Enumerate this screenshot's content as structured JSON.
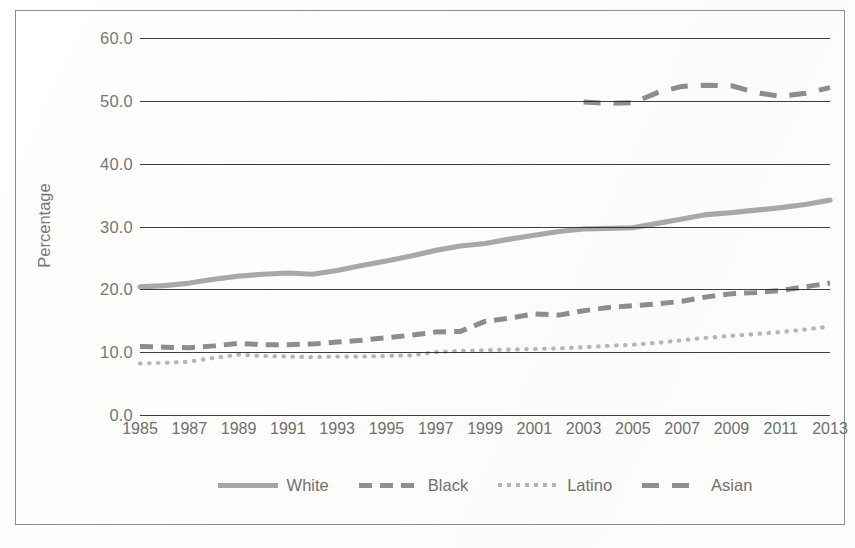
{
  "chart_data": {
    "type": "line",
    "title": "",
    "xlabel": "",
    "ylabel": "Percentage",
    "ylim": [
      0.0,
      60.0
    ],
    "yticks": [
      "0.0",
      "10.0",
      "20.0",
      "30.0",
      "40.0",
      "50.0",
      "60.0"
    ],
    "xlim": [
      1985,
      2013
    ],
    "xticks": [
      "1985",
      "1987",
      "1989",
      "1991",
      "1993",
      "1995",
      "1997",
      "1999",
      "2001",
      "2003",
      "2005",
      "2007",
      "2009",
      "2011",
      "2013"
    ],
    "x": [
      1985,
      1986,
      1987,
      1988,
      1989,
      1990,
      1991,
      1992,
      1993,
      1994,
      1995,
      1996,
      1997,
      1998,
      1999,
      2000,
      2001,
      2002,
      2003,
      2004,
      2005,
      2006,
      2007,
      2008,
      2009,
      2010,
      2011,
      2012,
      2013
    ],
    "grid": true,
    "legend_position": "bottom",
    "series": [
      {
        "name": "White",
        "style": "solid",
        "color": "#a8a8a8",
        "values": [
          20.4,
          20.6,
          21.0,
          21.6,
          22.1,
          22.4,
          22.6,
          22.4,
          23.0,
          23.8,
          24.5,
          25.3,
          26.2,
          26.9,
          27.3,
          28.0,
          28.6,
          29.2,
          29.6,
          29.7,
          29.8,
          30.5,
          31.2,
          31.9,
          32.2,
          32.6,
          33.0,
          33.5,
          34.2
        ]
      },
      {
        "name": "Black",
        "style": "dashed",
        "color": "#8d8d8d",
        "values": [
          10.9,
          10.8,
          10.7,
          11.0,
          11.4,
          11.2,
          11.2,
          11.3,
          11.6,
          11.9,
          12.3,
          12.7,
          13.2,
          13.3,
          14.9,
          15.4,
          16.1,
          15.9,
          16.6,
          17.1,
          17.4,
          17.7,
          18.1,
          18.8,
          19.3,
          19.5,
          19.8,
          20.4,
          21.0
        ]
      },
      {
        "name": "Latino",
        "style": "dotted",
        "color": "#b5b5b5",
        "values": [
          8.2,
          8.3,
          8.5,
          9.1,
          9.6,
          9.4,
          9.3,
          9.2,
          9.3,
          9.3,
          9.4,
          9.5,
          10.0,
          10.2,
          10.3,
          10.4,
          10.5,
          10.6,
          10.8,
          11.0,
          11.2,
          11.5,
          11.9,
          12.3,
          12.6,
          12.9,
          13.2,
          13.6,
          14.1
        ]
      },
      {
        "name": "Asian",
        "style": "long-dash",
        "color": "#8d8d8d",
        "start_year": 2003,
        "values": [
          null,
          null,
          null,
          null,
          null,
          null,
          null,
          null,
          null,
          null,
          null,
          null,
          null,
          null,
          null,
          null,
          null,
          null,
          49.8,
          49.6,
          49.7,
          51.3,
          52.3,
          52.5,
          52.4,
          51.3,
          50.7,
          51.2,
          52.1
        ]
      }
    ]
  },
  "axis": {
    "y_title": "Percentage",
    "y_ticks": [
      "60.0",
      "50.0",
      "40.0",
      "30.0",
      "20.0",
      "10.0",
      "0.0"
    ],
    "x_ticks": [
      "1985",
      "1987",
      "1989",
      "1991",
      "1993",
      "1995",
      "1997",
      "1999",
      "2001",
      "2003",
      "2005",
      "2007",
      "2009",
      "2011",
      "2013"
    ]
  },
  "legend": {
    "items": [
      {
        "label": "White",
        "swatch": "solid-line-swatch"
      },
      {
        "label": "Black",
        "swatch": "dashed-line-swatch"
      },
      {
        "label": "Latino",
        "swatch": "dotted-line-swatch"
      },
      {
        "label": "Asian",
        "swatch": "long-dash-line-swatch"
      }
    ]
  }
}
